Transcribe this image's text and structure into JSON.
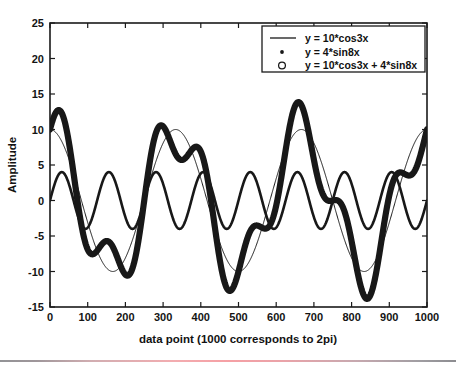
{
  "chart_data": {
    "type": "line",
    "title": "",
    "xlabel": "data point (1000 corresponds to 2pi)",
    "ylabel": "Amplitude",
    "xlim": [
      0,
      1000
    ],
    "ylim": [
      -15,
      25
    ],
    "xticks": [
      0,
      100,
      200,
      300,
      400,
      500,
      600,
      700,
      800,
      900,
      1000
    ],
    "yticks": [
      -15,
      -10,
      -5,
      0,
      5,
      10,
      15,
      20,
      25
    ],
    "xtick_labels": [
      "0",
      "100",
      "200",
      "300",
      "400",
      "500",
      "600",
      "700",
      "800",
      "900",
      "1000"
    ],
    "ytick_labels": [
      "-15",
      "-10",
      "-5",
      "0",
      "5",
      "10",
      "15",
      "20",
      "25"
    ],
    "grid": false,
    "legend_position": "upper right",
    "x_domain_note": "x runs 0..2pi over data points 0..1000",
    "series": [
      {
        "name": "y = 10*cos3x",
        "marker": "line",
        "amplitude": 10,
        "frequency": 3,
        "phase_function": "cos",
        "formula": "10*cos(3x)",
        "linewidth": 1.0,
        "color": "#181818"
      },
      {
        "name": "y = 4*sin8x",
        "marker": "dot",
        "amplitude": 4,
        "frequency": 8,
        "phase_function": "sin",
        "formula": "4*sin(8x)",
        "linewidth": 2.6,
        "color": "#181818"
      },
      {
        "name": "y = 10*cos3x + 4*sin8x",
        "marker": "circle",
        "formula": "10*cos(3x) + 4*sin(8x)",
        "linewidth": 6.2,
        "color": "#181818"
      }
    ],
    "legend_entries": [
      {
        "label": "y = 10*cos3x",
        "marker": "line"
      },
      {
        "label": "y = 4*sin8x",
        "marker": "dot"
      },
      {
        "label": "y = 10*cos3x + 4*sin8x",
        "marker": "circle"
      }
    ]
  },
  "figure": {
    "background_color": "#ffffff",
    "axis_color": "#1a1a1a"
  }
}
